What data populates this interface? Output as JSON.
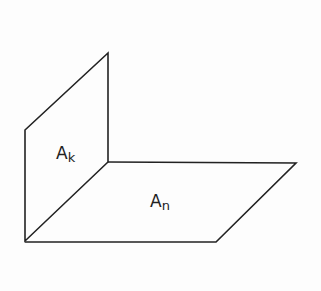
{
  "diagram": {
    "planes": [
      {
        "name": "vertical-plane",
        "label_main": "A",
        "label_sub": "k"
      },
      {
        "name": "horizontal-plane",
        "label_main": "A",
        "label_sub": "n"
      }
    ],
    "line_color": "#222222"
  }
}
